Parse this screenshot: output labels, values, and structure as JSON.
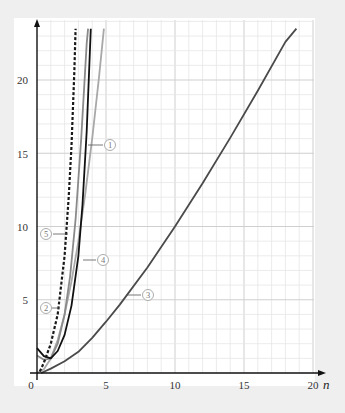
{
  "chart_data": {
    "type": "line",
    "title": "",
    "xlabel": "n",
    "ylabel": "",
    "xlim": [
      0,
      20
    ],
    "ylim": [
      0,
      23.5
    ],
    "grid": true,
    "x_ticks": [
      "0",
      "5",
      "10",
      "15",
      "20"
    ],
    "y_ticks": [
      "5",
      "10",
      "15",
      "20"
    ],
    "origin_label": "0",
    "legend": "circled-number labels attached to curves",
    "series": [
      {
        "name": "①",
        "label_text": "1",
        "style": "solid",
        "color": "#a8a8a8",
        "x": [
          0,
          0.5,
          1,
          1.5,
          2,
          2.5,
          3,
          3.5,
          4,
          4.5,
          4.85
        ],
        "y": [
          0,
          0.25,
          1,
          2.25,
          4,
          6.25,
          9,
          12.25,
          16,
          20.25,
          23.5
        ]
      },
      {
        "name": "②",
        "label_text": "2",
        "style": "dashed",
        "color": "#1a1a1a",
        "x": [
          0.2,
          0.5,
          1,
          1.5,
          2,
          2.3,
          2.5,
          2.7,
          2.8
        ],
        "y": [
          0.1,
          0.7,
          2.0,
          4.0,
          8.0,
          12.0,
          15.5,
          20.5,
          23.5
        ]
      },
      {
        "name": "③",
        "label_text": "3",
        "style": "solid",
        "color": "#4a4a4a",
        "x": [
          0.3,
          1,
          2,
          3,
          4,
          5,
          6,
          8,
          10,
          12,
          14,
          16,
          18,
          18.8
        ],
        "y": [
          0,
          0.3,
          0.8,
          1.45,
          2.4,
          3.5,
          4.67,
          7.2,
          10,
          12.95,
          16.05,
          19.27,
          22.6,
          23.5
        ]
      },
      {
        "name": "④",
        "label_text": "4",
        "style": "solid",
        "color": "#111111",
        "x": [
          0,
          0.5,
          1,
          1.5,
          2,
          2.5,
          3,
          3.3,
          3.6,
          3.9
        ],
        "y": [
          1.7,
          1.15,
          1.0,
          1.5,
          2.6,
          4.6,
          8.0,
          11.5,
          16.5,
          23.5
        ]
      },
      {
        "name": "⑤",
        "label_text": "5",
        "style": "solid",
        "color": "#8a8a8a",
        "x": [
          0,
          0.5,
          1,
          1.5,
          2,
          2.4,
          2.8,
          3.2,
          3.6,
          3.7
        ],
        "y": [
          1.2,
          0.9,
          1.0,
          2.0,
          4.0,
          6.6,
          10.5,
          16.0,
          22.5,
          23.5
        ]
      }
    ],
    "annotations": [
      {
        "text": "①",
        "x": 5.3,
        "y": 15.5,
        "points_to_series": "①"
      },
      {
        "text": "②",
        "x": 0.55,
        "y": 4.4,
        "points_to_series": "②"
      },
      {
        "text": "③",
        "x": 8.3,
        "y": 5.0,
        "points_to_series": "③"
      },
      {
        "text": "④",
        "x": 5.0,
        "y": 7.7,
        "points_to_series": "④"
      },
      {
        "text": "⑤",
        "x": 0.6,
        "y": 9.5,
        "points_to_series": "⑤"
      }
    ]
  },
  "axes": {
    "x_axis_label": "n",
    "origin": "0",
    "x_tick_labels": [
      "5",
      "10",
      "15",
      "20"
    ],
    "y_tick_labels": [
      "5",
      "10",
      "15",
      "20"
    ]
  }
}
